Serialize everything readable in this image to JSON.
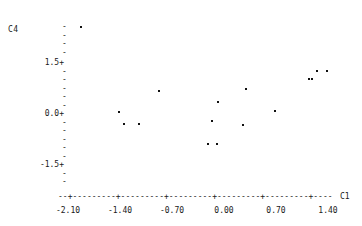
{
  "chart_data": {
    "type": "scatter",
    "title": "",
    "xlabel": "C1",
    "ylabel": "C4",
    "xlim": [
      -2.45,
      1.85
    ],
    "ylim": [
      -2.35,
      2.75
    ],
    "grid": false,
    "legend": null,
    "x_ticks": [
      {
        "value": -2.1,
        "label": "-2.10"
      },
      {
        "value": -1.4,
        "label": "-1.40"
      },
      {
        "value": -0.7,
        "label": "-0.70"
      },
      {
        "value": 0.0,
        "label": "0.00"
      },
      {
        "value": 0.7,
        "label": "0.70"
      },
      {
        "value": 1.4,
        "label": "1.40"
      }
    ],
    "y_ticks": [
      {
        "value": 2.55,
        "label": "-"
      },
      {
        "value": 2.3,
        "label": "-"
      },
      {
        "value": 2.05,
        "label": "-"
      },
      {
        "value": 1.8,
        "label": "-"
      },
      {
        "value": 1.5,
        "label": "1.5+"
      },
      {
        "value": 1.25,
        "label": "-"
      },
      {
        "value": 1.0,
        "label": "-"
      },
      {
        "value": 0.75,
        "label": "-"
      },
      {
        "value": 0.5,
        "label": "-"
      },
      {
        "value": 0.25,
        "label": "-"
      },
      {
        "value": 0.0,
        "label": "0.0+"
      },
      {
        "value": -0.25,
        "label": "-"
      },
      {
        "value": -0.5,
        "label": "-"
      },
      {
        "value": -0.75,
        "label": "-"
      },
      {
        "value": -1.0,
        "label": "-"
      },
      {
        "value": -1.25,
        "label": "-"
      },
      {
        "value": -1.5,
        "label": "-1.5+"
      },
      {
        "value": -1.75,
        "label": "-"
      },
      {
        "value": -2.0,
        "label": "-"
      }
    ],
    "x_axis_line": "--+---------+---------+---------+---------+---------+----",
    "points": [
      {
        "x": -1.93,
        "y": 2.55
      },
      {
        "x": -1.42,
        "y": 0.05
      },
      {
        "x": -1.35,
        "y": -0.28
      },
      {
        "x": -1.14,
        "y": -0.28
      },
      {
        "x": -0.87,
        "y": 0.68
      },
      {
        "x": 0.3,
        "y": 0.73
      },
      {
        "x": -0.08,
        "y": 0.34
      },
      {
        "x": 0.68,
        "y": 0.09
      },
      {
        "x": -0.16,
        "y": -0.2
      },
      {
        "x": 0.25,
        "y": -0.31
      },
      {
        "x": -0.22,
        "y": -0.88
      },
      {
        "x": -0.1,
        "y": -0.88
      },
      {
        "x": 1.14,
        "y": 1.03
      },
      {
        "x": 1.19,
        "y": 1.03
      },
      {
        "x": 1.25,
        "y": 1.27
      },
      {
        "x": 1.38,
        "y": 1.27
      }
    ]
  },
  "axis": {
    "y_title": "C4",
    "x_title": "C1"
  }
}
